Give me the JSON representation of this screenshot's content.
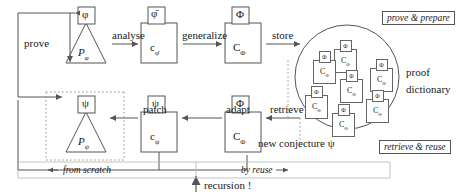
{
  "diagram": {
    "title_hidden": "",
    "tags": {
      "top_right": "prove & prepare",
      "bottom_right": "retrieve & reuse"
    },
    "dictionary_label_line1": "proof",
    "dictionary_label_line2": "dictionary",
    "operations": {
      "prove": "prove",
      "analyse": "analyse",
      "generalize": "generalize",
      "store": "store",
      "retrieve": "retrieve",
      "adapt": "adapt",
      "patch": "patch"
    },
    "footer": {
      "from_scratch": "from scratch",
      "by_reuse": "by reuse",
      "recursion": "recursion !",
      "new_conjecture": "new conjecture ψ"
    },
    "top_row": [
      {
        "name": "proof-phi",
        "shape": "triangle",
        "top_symbol": "φ",
        "body_symbol": "P",
        "body_sub": "φ"
      },
      {
        "name": "certificate-phi-bar",
        "shape": "box",
        "top_symbol": "φ̄",
        "body_symbol": "c",
        "body_sub": "φ̄"
      },
      {
        "name": "certificate-capital-phi",
        "shape": "box",
        "top_symbol": "Φ",
        "body_symbol": "C",
        "body_sub": "Φ"
      }
    ],
    "bottom_row": [
      {
        "name": "proof-psi",
        "shape": "triangle",
        "top_symbol": "ψ",
        "body_symbol": "P",
        "body_sub": "ψ"
      },
      {
        "name": "certificate-psi",
        "shape": "box",
        "top_symbol": "ψ",
        "body_symbol": "c",
        "body_sub": "ψ"
      },
      {
        "name": "certificate-capital-phi-retrieved",
        "shape": "box",
        "top_symbol": "Φ",
        "body_symbol": "C",
        "body_sub": "Φ"
      }
    ],
    "dictionary_entries": [
      {
        "top_symbol": "Φ",
        "body_symbol": "C",
        "body_sub": "Φ",
        "x": 334,
        "y": 40
      },
      {
        "top_symbol": "Φ",
        "body_symbol": "C",
        "body_sub": "Φ",
        "x": 313,
        "y": 51
      },
      {
        "top_symbol": "Φ",
        "body_symbol": "C",
        "body_sub": "Φ",
        "x": 370,
        "y": 59
      },
      {
        "top_symbol": "Φ",
        "body_symbol": "C",
        "body_sub": "Φ",
        "x": 340,
        "y": 70
      },
      {
        "top_symbol": "Φ",
        "body_symbol": "C",
        "body_sub": "Φ",
        "x": 305,
        "y": 86
      },
      {
        "top_symbol": "Φ",
        "body_symbol": "C",
        "body_sub": "Φ",
        "x": 366,
        "y": 90
      },
      {
        "top_symbol": "Φ",
        "body_symbol": "C",
        "body_sub": "Φ",
        "x": 332,
        "y": 104
      }
    ],
    "colors": {
      "stroke": "#555555",
      "text": "#1a1a1a",
      "dotted": "#888888",
      "background": "#ffffff"
    }
  }
}
